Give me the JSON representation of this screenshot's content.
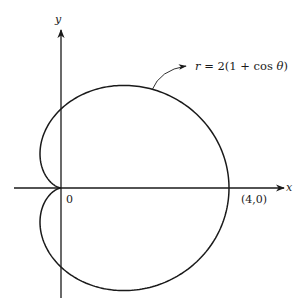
{
  "figure": {
    "type": "polar-curve",
    "curve_label": "r = 2(1 + cos θ)",
    "curve_label_parts": {
      "r": "r",
      "eq": " = 2(1 + cos ",
      "theta": "θ",
      "close": ")"
    },
    "x_axis_label": "x",
    "y_axis_label": "y",
    "origin_label": "0",
    "point_label": "(4,0)",
    "equation": {
      "a": 2,
      "form": "r = a(1 + cos θ)"
    },
    "colors": {
      "stroke": "#1a1a1a",
      "background": "#ffffff"
    }
  }
}
